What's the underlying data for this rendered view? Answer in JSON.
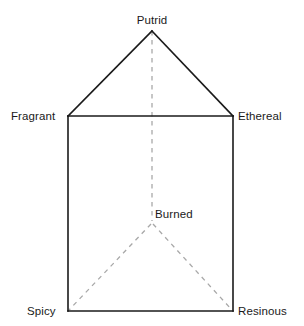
{
  "figure": {
    "background_color": "#ffffff",
    "solid_line_color": "#1a1a1a",
    "dashed_line_color": "#a8a8a8",
    "label_color": "#1a1a1a"
  },
  "vertices": {
    "putrid": {
      "label": "Putrid",
      "x": 152,
      "y": 31
    },
    "fragrant": {
      "label": "Fragrant",
      "x": 68,
      "y": 116
    },
    "ethereal": {
      "label": "Ethereal",
      "x": 233,
      "y": 116
    },
    "spicy": {
      "label": "Spicy",
      "x": 68,
      "y": 311
    },
    "resinous": {
      "label": "Resinous",
      "x": 233,
      "y": 311
    },
    "burned": {
      "label": "Burned",
      "x": 152,
      "y": 223
    }
  },
  "edges": {
    "solid": [
      {
        "name": "fragrant-to-putrid",
        "from": "fragrant",
        "to": "putrid"
      },
      {
        "name": "putrid-to-ethereal",
        "from": "putrid",
        "to": "ethereal"
      },
      {
        "name": "fragrant-to-ethereal",
        "from": "fragrant",
        "to": "ethereal"
      },
      {
        "name": "fragrant-to-spicy",
        "from": "fragrant",
        "to": "spicy"
      },
      {
        "name": "ethereal-to-resinous",
        "from": "ethereal",
        "to": "resinous"
      },
      {
        "name": "spicy-to-resinous",
        "from": "spicy",
        "to": "resinous"
      }
    ],
    "dashed": [
      {
        "name": "putrid-to-burned",
        "from": "putrid",
        "to": "burned"
      },
      {
        "name": "burned-to-spicy",
        "from": "burned",
        "to": "spicy"
      },
      {
        "name": "burned-to-resinous",
        "from": "burned",
        "to": "resinous"
      }
    ]
  }
}
